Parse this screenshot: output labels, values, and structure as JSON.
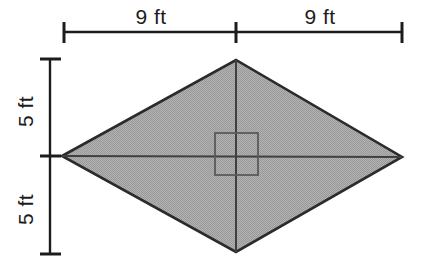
{
  "figure": {
    "background_color": "#ffffff",
    "width": 435,
    "height": 276
  },
  "shape": {
    "name": "rhombus",
    "fill_color": "#a9a9a9",
    "stroke_color": "#2b2b2b",
    "vertices": {
      "left": [
        62,
        156
      ],
      "top": [
        236,
        60
      ],
      "right": [
        402,
        157
      ],
      "bottom": [
        236,
        252
      ]
    }
  },
  "diagonals": {
    "stroke_color": "#4a4a4a",
    "horizontal": [
      [
        62,
        156
      ],
      [
        402,
        157
      ]
    ],
    "vertical": [
      [
        236,
        60
      ],
      [
        236,
        252
      ]
    ]
  },
  "inner_square": {
    "name": "center-square",
    "stroke_color": "#5a5a5a",
    "fill": "none",
    "x": 215,
    "y": 133,
    "width": 43,
    "height": 42
  },
  "dimensions": {
    "top": {
      "line_color": "#1c1c1c",
      "y": 32,
      "x_start": 63,
      "x_end": 403,
      "x_center_tick": 236,
      "segments": [
        {
          "label": "9 ft",
          "value": 9,
          "unit": "ft"
        },
        {
          "label": "9 ft",
          "value": 9,
          "unit": "ft"
        }
      ]
    },
    "left": {
      "line_color": "#1c1c1c",
      "x": 50,
      "y_start": 58,
      "y_end": 255,
      "y_center_tick": 156,
      "segments": [
        {
          "label": "5 ft",
          "value": 5,
          "unit": "ft"
        },
        {
          "label": "5 ft",
          "value": 5,
          "unit": "ft"
        }
      ]
    }
  },
  "labels": {
    "top_left": "9 ft",
    "top_right": "9 ft",
    "left_upper": "5 ft",
    "left_lower": "5 ft"
  }
}
